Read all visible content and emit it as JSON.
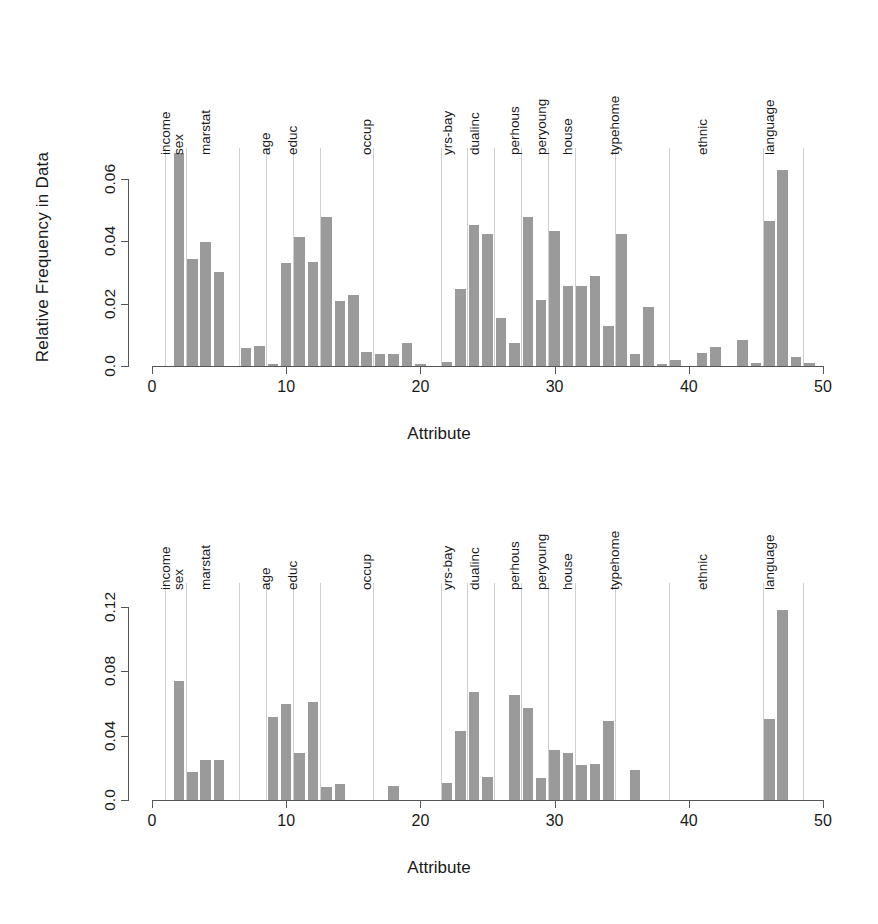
{
  "figure": {
    "xlabel": "Attribute",
    "group_labels": [
      "income",
      "sex",
      "marstat",
      "age",
      "educ",
      "occup",
      "yrs-bay",
      "dualinc",
      "perhous",
      "peryoung",
      "house",
      "typehome",
      "ethnic",
      "language"
    ],
    "bar_color": "#9a9a9a",
    "divider_color": "#cfcfcf",
    "axis_color": "#555555"
  },
  "chart_data": [
    {
      "type": "bar",
      "title": "",
      "xlabel": "Attribute",
      "ylabel": "Relative Frequency in Data",
      "xlim": [
        0,
        50
      ],
      "ylim": [
        0,
        0.07
      ],
      "xticks": [
        "0",
        "10",
        "20",
        "30",
        "40",
        "50"
      ],
      "xtick_values": [
        0,
        10,
        20,
        30,
        40,
        50
      ],
      "yticks": [
        "0.0",
        "0.02",
        "0.04",
        "0.06"
      ],
      "ytick_values": [
        0.0,
        0.02,
        0.04,
        0.06
      ],
      "grid": false,
      "legend": "none",
      "x": [
        1,
        2,
        3,
        4,
        5,
        6,
        7,
        8,
        9,
        10,
        11,
        12,
        13,
        14,
        15,
        16,
        17,
        18,
        19,
        20,
        21,
        22,
        23,
        24,
        25,
        26,
        27,
        28,
        29,
        30,
        31,
        32,
        33,
        34,
        35,
        36,
        37,
        38,
        39,
        40,
        41,
        42,
        43,
        44,
        45,
        46,
        47,
        48,
        49,
        50
      ],
      "values": [
        0.0,
        0.0685,
        0.0345,
        0.0398,
        0.0302,
        0.0,
        0.0057,
        0.0065,
        0.0008,
        0.0332,
        0.0415,
        0.0335,
        0.048,
        0.0208,
        0.0228,
        0.0044,
        0.0038,
        0.004,
        0.0075,
        0.0008,
        0.0,
        0.0014,
        0.0247,
        0.0452,
        0.0425,
        0.0153,
        0.0074,
        0.0478,
        0.0212,
        0.0432,
        0.0258,
        0.0256,
        0.029,
        0.0129,
        0.0424,
        0.004,
        0.0191,
        0.0005,
        0.002,
        0.0,
        0.0043,
        0.006,
        0.0,
        0.0084,
        0.001,
        0.0465,
        0.063,
        0.003,
        0.001,
        0.0
      ],
      "group_label_positions": [
        2,
        3,
        5,
        9.5,
        11.5,
        17,
        23,
        25,
        28,
        30,
        32,
        35.5,
        42,
        47
      ],
      "divider_attributes": [
        1,
        2.5,
        6.5,
        8.5,
        10.5,
        12.5,
        16.5,
        21.5,
        23.5,
        25.5,
        27.5,
        29.5,
        31.5,
        34.5,
        38.5,
        45.5,
        48.5
      ]
    },
    {
      "type": "bar",
      "title": "",
      "xlabel": "Attribute",
      "ylabel": "Relative Frequency in Association Rules",
      "xlim": [
        0,
        50
      ],
      "ylim": [
        0,
        0.135
      ],
      "xticks": [
        "0",
        "10",
        "20",
        "30",
        "40",
        "50"
      ],
      "xtick_values": [
        0,
        10,
        20,
        30,
        40,
        50
      ],
      "yticks": [
        "0.0",
        "0.04",
        "0.08",
        "0.12"
      ],
      "ytick_values": [
        0.0,
        0.04,
        0.08,
        0.12
      ],
      "grid": false,
      "legend": "none",
      "x": [
        1,
        2,
        3,
        4,
        5,
        6,
        7,
        8,
        9,
        10,
        11,
        12,
        13,
        14,
        15,
        16,
        17,
        18,
        19,
        20,
        21,
        22,
        23,
        24,
        25,
        26,
        27,
        28,
        29,
        30,
        31,
        32,
        33,
        34,
        35,
        36,
        37,
        38,
        39,
        40,
        41,
        42,
        43,
        44,
        45,
        46,
        47,
        48,
        49,
        50
      ],
      "values": [
        0.0,
        0.074,
        0.0172,
        0.0251,
        0.0247,
        0.0,
        0.0,
        0.0,
        0.0518,
        0.06,
        0.029,
        0.061,
        0.008,
        0.0098,
        0.0,
        0.0,
        0.0,
        0.009,
        0.0,
        0.0,
        0.0,
        0.0104,
        0.043,
        0.0675,
        0.0145,
        0.0,
        0.0655,
        0.057,
        0.014,
        0.031,
        0.029,
        0.022,
        0.0227,
        0.049,
        0.0,
        0.0185,
        0.0,
        0.0,
        0.0,
        0.0,
        0.0,
        0.0,
        0.0,
        0.0,
        0.0,
        0.0505,
        0.1185,
        0.0,
        0.0,
        0.0
      ],
      "group_label_positions": [
        2,
        3,
        5,
        9.5,
        11.5,
        17,
        23,
        25,
        28,
        30,
        32,
        35.5,
        42,
        47
      ],
      "divider_attributes": [
        1,
        2.5,
        6.5,
        8.5,
        10.5,
        12.5,
        16.5,
        21.5,
        23.5,
        25.5,
        27.5,
        29.5,
        31.5,
        34.5,
        38.5,
        45.5,
        48.5
      ]
    }
  ]
}
